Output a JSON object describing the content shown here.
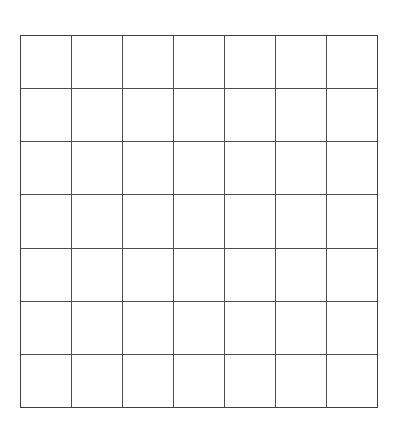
{
  "document": {
    "kind": "blank-grid-worksheet",
    "background_color": "#ffffff",
    "page_width": 399,
    "page_height": 421
  },
  "grid": {
    "columns": 7,
    "rows": 7,
    "line_color": "#4d4d4d",
    "frame_color": "#3f3f3f",
    "line_width_px": 2,
    "cell_fill": "#ffffff",
    "left_px": 20,
    "top_px": 35,
    "width_px": 358,
    "height_px": 373,
    "cell_width_px": 51,
    "cell_height_px": 53,
    "cells": [
      [
        "",
        "",
        "",
        "",
        "",
        "",
        ""
      ],
      [
        "",
        "",
        "",
        "",
        "",
        "",
        ""
      ],
      [
        "",
        "",
        "",
        "",
        "",
        "",
        ""
      ],
      [
        "",
        "",
        "",
        "",
        "",
        "",
        ""
      ],
      [
        "",
        "",
        "",
        "",
        "",
        "",
        ""
      ],
      [
        "",
        "",
        "",
        "",
        "",
        "",
        ""
      ],
      [
        "",
        "",
        "",
        "",
        "",
        "",
        ""
      ]
    ]
  }
}
